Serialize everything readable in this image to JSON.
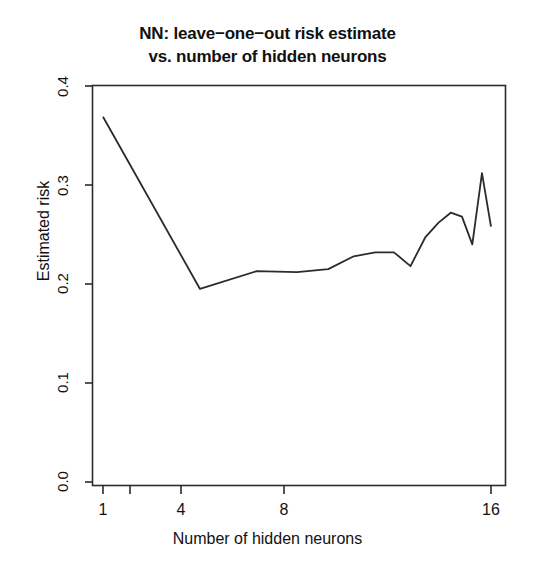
{
  "chart_data": {
    "type": "line",
    "title_line1": "NN: leave−one−out risk estimate",
    "title_line2": "vs. number of hidden neurons",
    "xlabel": "Number of hidden neurons",
    "ylabel": "Estimated risk",
    "x_scale": "log2",
    "x": [
      1,
      2,
      3,
      4,
      5,
      6,
      7,
      8,
      9,
      10,
      11,
      12,
      13,
      14,
      15,
      16
    ],
    "values": [
      0.369,
      0.195,
      0.213,
      0.212,
      0.215,
      0.228,
      0.232,
      0.232,
      0.218,
      0.247,
      0.262,
      0.272,
      0.268,
      0.24,
      0.312,
      0.258
    ],
    "series": [
      {
        "name": "Estimated risk",
        "values": [
          0.369,
          0.195,
          0.213,
          0.212,
          0.215,
          0.228,
          0.232,
          0.232,
          0.218,
          0.247,
          0.262,
          0.272,
          0.268,
          0.24,
          0.312,
          0.258
        ]
      }
    ],
    "xlim": [
      1,
      16
    ],
    "ylim": [
      0.0,
      0.4
    ],
    "xticks": [
      1,
      2,
      4,
      8,
      16
    ],
    "xtick_labels": [
      "1",
      "",
      "4",
      "8",
      "16"
    ],
    "yticks": [
      0.0,
      0.1,
      0.2,
      0.3,
      0.4
    ],
    "ytick_labels": [
      "0.0",
      "0.1",
      "0.2",
      "0.3",
      "0.4"
    ],
    "grid": false,
    "legend": false,
    "line_color": "#2b2b2b",
    "axis_color": "#2b2b2b",
    "background": "#ffffff"
  }
}
